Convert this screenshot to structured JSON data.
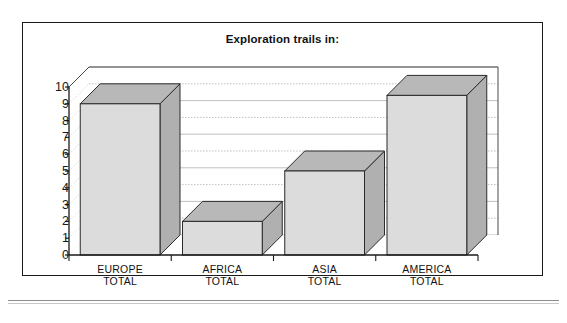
{
  "figure": {
    "title": "Exploration trails in:",
    "border_color": "#1a1a1a",
    "background": "#ffffff"
  },
  "colors": {
    "bar_front": "#dcdcdc",
    "bar_side": "#b0b0b0",
    "bar_top": "#b8b8b8",
    "bar_outline": "#2b2b2b",
    "gridline": "#b9b9b9",
    "floor_wedge": "#6f6f6f",
    "axis": "#1a1a1a",
    "text": "#111111"
  },
  "chart_data": {
    "type": "bar",
    "title": "Exploration trails in:",
    "xlabel": "",
    "ylabel": "",
    "categories": [
      "EUROPE TOTAL",
      "AFRICA TOTAL",
      "ASIA TOTAL",
      "AMERICA TOTAL"
    ],
    "category_lines": [
      [
        "EUROPE",
        "TOTAL"
      ],
      [
        "AFRICA",
        "TOTAL"
      ],
      [
        "ASIA",
        "TOTAL"
      ],
      [
        "AMERICA",
        "TOTAL"
      ]
    ],
    "values": [
      9,
      2,
      5,
      9.5
    ],
    "ylim": [
      0,
      10
    ],
    "yticks": [
      0,
      1,
      2,
      3,
      4,
      5,
      6,
      7,
      8,
      9,
      10
    ],
    "ytick_labels": [
      "0",
      "1",
      "2",
      "3",
      "4",
      "5",
      "6",
      "7",
      "8",
      "9",
      "10"
    ],
    "grid": true,
    "grid_axis": "y",
    "legend": false,
    "projection": "3d-isometric"
  },
  "y_axis": {
    "labels": [
      "10",
      "9",
      "8",
      "7",
      "6",
      "5",
      "4",
      "3",
      "2",
      "1",
      "0"
    ]
  }
}
